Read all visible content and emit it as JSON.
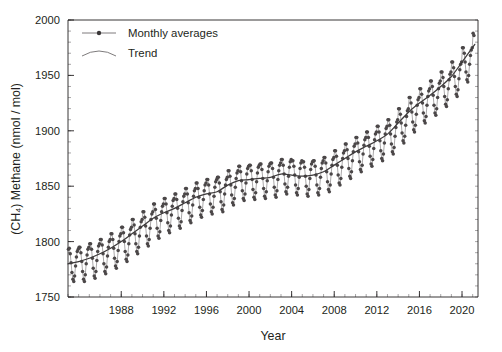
{
  "chart_data": {
    "type": "line",
    "title": "",
    "xlabel": "Year",
    "ylabel": "(CH₄) Methane (nmol / mol)",
    "xlim": [
      1983.0,
      2021.5
    ],
    "ylim": [
      1750,
      2000
    ],
    "xticks": [
      1988,
      1992,
      1996,
      2000,
      2004,
      2008,
      2012,
      2016,
      2020
    ],
    "xtick_labels": [
      "1988",
      "1992",
      "1996",
      "2000",
      "2004",
      "2008",
      "2012",
      "2016",
      "2020"
    ],
    "x_minor_step": 1,
    "yticks": [
      1750,
      1800,
      1850,
      1900,
      1950,
      2000
    ],
    "ytick_labels": [
      "1750",
      "1800",
      "1850",
      "1900",
      "1950",
      "2000"
    ],
    "y_minor_step": 10,
    "grid": false,
    "legend_position": "top-left",
    "legend": [
      {
        "label": "Monthly averages",
        "marker": "filled-circle",
        "line": "solid"
      },
      {
        "label": "Trend",
        "marker": "none",
        "line": "curve"
      }
    ],
    "series": [
      {
        "name": "Monthly averages",
        "color": "#4b4748",
        "x": [
          1983.04,
          1983.12,
          1983.21,
          1983.29,
          1983.37,
          1983.46,
          1983.54,
          1983.62,
          1983.71,
          1983.79,
          1983.87,
          1983.96,
          1984.04,
          1984.12,
          1984.21,
          1984.29,
          1984.37,
          1984.46,
          1984.54,
          1984.62,
          1984.71,
          1984.79,
          1984.87,
          1984.96,
          1985.04,
          1985.12,
          1985.21,
          1985.29,
          1985.37,
          1985.46,
          1985.54,
          1985.62,
          1985.71,
          1985.79,
          1985.87,
          1985.96,
          1986.04,
          1986.12,
          1986.21,
          1986.29,
          1986.37,
          1986.46,
          1986.54,
          1986.62,
          1986.71,
          1986.79,
          1986.87,
          1986.96,
          1987.04,
          1987.12,
          1987.21,
          1987.29,
          1987.37,
          1987.46,
          1987.54,
          1987.62,
          1987.71,
          1987.79,
          1987.87,
          1987.96,
          1988.04,
          1988.12,
          1988.21,
          1988.29,
          1988.37,
          1988.46,
          1988.54,
          1988.62,
          1988.71,
          1988.79,
          1988.87,
          1988.96,
          1989.04,
          1989.12,
          1989.21,
          1989.29,
          1989.37,
          1989.46,
          1989.54,
          1989.62,
          1989.71,
          1989.79,
          1989.87,
          1989.96,
          1990.04,
          1990.12,
          1990.21,
          1990.29,
          1990.37,
          1990.46,
          1990.54,
          1990.62,
          1990.71,
          1990.79,
          1990.87,
          1990.96,
          1991.04,
          1991.12,
          1991.21,
          1991.29,
          1991.37,
          1991.46,
          1991.54,
          1991.62,
          1991.71,
          1991.79,
          1991.87,
          1991.96,
          1992.04,
          1992.12,
          1992.21,
          1992.29,
          1992.37,
          1992.46,
          1992.54,
          1992.62,
          1992.71,
          1992.79,
          1992.87,
          1992.96,
          1993.04,
          1993.12,
          1993.21,
          1993.29,
          1993.37,
          1993.46,
          1993.54,
          1993.62,
          1993.71,
          1993.79,
          1993.87,
          1993.96,
          1994.04,
          1994.12,
          1994.21,
          1994.29,
          1994.37,
          1994.46,
          1994.54,
          1994.62,
          1994.71,
          1994.79,
          1994.87,
          1994.96,
          1995.04,
          1995.12,
          1995.21,
          1995.29,
          1995.37,
          1995.46,
          1995.54,
          1995.62,
          1995.71,
          1995.79,
          1995.87,
          1995.96,
          1996.04,
          1996.12,
          1996.21,
          1996.29,
          1996.37,
          1996.46,
          1996.54,
          1996.62,
          1996.71,
          1996.79,
          1996.87,
          1996.96,
          1997.04,
          1997.12,
          1997.21,
          1997.29,
          1997.37,
          1997.46,
          1997.54,
          1997.62,
          1997.71,
          1997.79,
          1997.87,
          1997.96,
          1998.04,
          1998.12,
          1998.21,
          1998.29,
          1998.37,
          1998.46,
          1998.54,
          1998.62,
          1998.71,
          1998.79,
          1998.87,
          1998.96,
          1999.04,
          1999.12,
          1999.21,
          1999.29,
          1999.37,
          1999.46,
          1999.54,
          1999.62,
          1999.71,
          1999.79,
          1999.87,
          1999.96,
          2000.04,
          2000.12,
          2000.21,
          2000.29,
          2000.37,
          2000.46,
          2000.54,
          2000.62,
          2000.71,
          2000.79,
          2000.87,
          2000.96,
          2001.04,
          2001.12,
          2001.21,
          2001.29,
          2001.37,
          2001.46,
          2001.54,
          2001.62,
          2001.71,
          2001.79,
          2001.87,
          2001.96,
          2002.04,
          2002.12,
          2002.21,
          2002.29,
          2002.37,
          2002.46,
          2002.54,
          2002.62,
          2002.71,
          2002.79,
          2002.87,
          2002.96,
          2003.04,
          2003.12,
          2003.21,
          2003.29,
          2003.37,
          2003.46,
          2003.54,
          2003.62,
          2003.71,
          2003.79,
          2003.87,
          2003.96,
          2004.04,
          2004.12,
          2004.21,
          2004.29,
          2004.37,
          2004.46,
          2004.54,
          2004.62,
          2004.71,
          2004.79,
          2004.87,
          2004.96,
          2005.04,
          2005.12,
          2005.21,
          2005.29,
          2005.37,
          2005.46,
          2005.54,
          2005.62,
          2005.71,
          2005.79,
          2005.87,
          2005.96,
          2006.04,
          2006.12,
          2006.21,
          2006.29,
          2006.37,
          2006.46,
          2006.54,
          2006.62,
          2006.71,
          2006.79,
          2006.87,
          2006.96,
          2007.04,
          2007.12,
          2007.21,
          2007.29,
          2007.37,
          2007.46,
          2007.54,
          2007.62,
          2007.71,
          2007.79,
          2007.87,
          2007.96,
          2008.04,
          2008.12,
          2008.21,
          2008.29,
          2008.37,
          2008.46,
          2008.54,
          2008.62,
          2008.71,
          2008.79,
          2008.87,
          2008.96,
          2009.04,
          2009.12,
          2009.21,
          2009.29,
          2009.37,
          2009.46,
          2009.54,
          2009.62,
          2009.71,
          2009.79,
          2009.87,
          2009.96,
          2010.04,
          2010.12,
          2010.21,
          2010.29,
          2010.37,
          2010.46,
          2010.54,
          2010.62,
          2010.71,
          2010.79,
          2010.87,
          2010.96,
          2011.04,
          2011.12,
          2011.21,
          2011.29,
          2011.37,
          2011.46,
          2011.54,
          2011.62,
          2011.71,
          2011.79,
          2011.87,
          2011.96,
          2012.04,
          2012.12,
          2012.21,
          2012.29,
          2012.37,
          2012.46,
          2012.54,
          2012.62,
          2012.71,
          2012.79,
          2012.87,
          2012.96,
          2013.04,
          2013.12,
          2013.21,
          2013.29,
          2013.37,
          2013.46,
          2013.54,
          2013.62,
          2013.71,
          2013.79,
          2013.87,
          2013.96,
          2014.04,
          2014.12,
          2014.21,
          2014.29,
          2014.37,
          2014.46,
          2014.54,
          2014.62,
          2014.71,
          2014.79,
          2014.87,
          2014.96,
          2015.04,
          2015.12,
          2015.21,
          2015.29,
          2015.37,
          2015.46,
          2015.54,
          2015.62,
          2015.71,
          2015.79,
          2015.87,
          2015.96,
          2016.04,
          2016.12,
          2016.21,
          2016.29,
          2016.37,
          2016.46,
          2016.54,
          2016.62,
          2016.71,
          2016.79,
          2016.87,
          2016.96,
          2017.04,
          2017.12,
          2017.21,
          2017.29,
          2017.37,
          2017.46,
          2017.54,
          2017.62,
          2017.71,
          2017.79,
          2017.87,
          2017.96,
          2018.04,
          2018.12,
          2018.21,
          2018.29,
          2018.37,
          2018.46,
          2018.54,
          2018.62,
          2018.71,
          2018.79,
          2018.87,
          2018.96,
          2019.04,
          2019.12,
          2019.21,
          2019.29,
          2019.37,
          2019.46,
          2019.54,
          2019.62,
          2019.71,
          2019.79,
          2019.87,
          2019.96,
          2020.04,
          2020.12,
          2020.21,
          2020.29,
          2020.37,
          2020.46,
          2020.54,
          2020.62,
          2020.71,
          2020.79,
          2020.87,
          2020.96,
          2021.04,
          2021.12
        ],
        "values": [
          1793,
          1794,
          1789,
          1781,
          1772,
          1766,
          1764,
          1769,
          1778,
          1786,
          1791,
          1793,
          1795,
          1795,
          1790,
          1782,
          1773,
          1766,
          1764,
          1770,
          1780,
          1788,
          1793,
          1795,
          1798,
          1798,
          1793,
          1785,
          1776,
          1769,
          1767,
          1773,
          1783,
          1791,
          1796,
          1798,
          1802,
          1802,
          1797,
          1789,
          1780,
          1773,
          1771,
          1777,
          1787,
          1795,
          1800,
          1802,
          1807,
          1807,
          1802,
          1794,
          1785,
          1778,
          1776,
          1782,
          1792,
          1800,
          1805,
          1807,
          1813,
          1813,
          1808,
          1800,
          1791,
          1784,
          1782,
          1788,
          1798,
          1806,
          1811,
          1813,
          1820,
          1820,
          1815,
          1807,
          1798,
          1791,
          1789,
          1795,
          1805,
          1813,
          1818,
          1820,
          1827,
          1827,
          1822,
          1814,
          1805,
          1798,
          1796,
          1802,
          1812,
          1820,
          1825,
          1827,
          1834,
          1834,
          1829,
          1821,
          1812,
          1805,
          1803,
          1809,
          1819,
          1827,
          1832,
          1834,
          1839,
          1839,
          1834,
          1826,
          1817,
          1810,
          1808,
          1814,
          1824,
          1832,
          1837,
          1839,
          1843,
          1843,
          1838,
          1830,
          1821,
          1814,
          1812,
          1818,
          1828,
          1836,
          1841,
          1843,
          1848,
          1848,
          1843,
          1835,
          1826,
          1819,
          1817,
          1823,
          1833,
          1841,
          1846,
          1848,
          1853,
          1853,
          1848,
          1840,
          1831,
          1824,
          1822,
          1828,
          1838,
          1846,
          1851,
          1853,
          1856,
          1856,
          1851,
          1843,
          1834,
          1827,
          1825,
          1831,
          1841,
          1849,
          1854,
          1856,
          1858,
          1858,
          1853,
          1845,
          1836,
          1829,
          1827,
          1833,
          1843,
          1851,
          1856,
          1858,
          1864,
          1864,
          1859,
          1851,
          1842,
          1835,
          1833,
          1839,
          1849,
          1857,
          1862,
          1864,
          1868,
          1868,
          1863,
          1855,
          1846,
          1839,
          1837,
          1843,
          1853,
          1861,
          1866,
          1868,
          1869,
          1869,
          1864,
          1856,
          1847,
          1840,
          1838,
          1844,
          1854,
          1862,
          1867,
          1869,
          1870,
          1870,
          1865,
          1857,
          1848,
          1841,
          1839,
          1845,
          1855,
          1863,
          1868,
          1870,
          1871,
          1871,
          1866,
          1858,
          1849,
          1842,
          1840,
          1846,
          1856,
          1864,
          1869,
          1871,
          1874,
          1874,
          1869,
          1861,
          1852,
          1845,
          1843,
          1849,
          1859,
          1867,
          1872,
          1874,
          1873,
          1873,
          1868,
          1860,
          1851,
          1844,
          1842,
          1848,
          1858,
          1866,
          1871,
          1873,
          1872,
          1872,
          1867,
          1859,
          1850,
          1843,
          1841,
          1847,
          1857,
          1865,
          1870,
          1872,
          1873,
          1873,
          1868,
          1860,
          1851,
          1844,
          1842,
          1848,
          1858,
          1866,
          1871,
          1873,
          1876,
          1876,
          1871,
          1863,
          1854,
          1847,
          1845,
          1851,
          1861,
          1869,
          1874,
          1876,
          1882,
          1882,
          1877,
          1869,
          1860,
          1853,
          1851,
          1857,
          1867,
          1875,
          1880,
          1882,
          1888,
          1888,
          1883,
          1875,
          1866,
          1859,
          1857,
          1863,
          1873,
          1881,
          1886,
          1888,
          1894,
          1894,
          1889,
          1881,
          1872,
          1865,
          1863,
          1869,
          1879,
          1887,
          1892,
          1894,
          1899,
          1899,
          1894,
          1886,
          1877,
          1870,
          1868,
          1874,
          1884,
          1892,
          1897,
          1899,
          1904,
          1904,
          1899,
          1891,
          1882,
          1875,
          1873,
          1879,
          1889,
          1897,
          1902,
          1904,
          1910,
          1910,
          1905,
          1897,
          1888,
          1881,
          1879,
          1885,
          1895,
          1903,
          1908,
          1910,
          1920,
          1920,
          1915,
          1907,
          1898,
          1891,
          1889,
          1895,
          1905,
          1913,
          1918,
          1920,
          1930,
          1930,
          1925,
          1917,
          1908,
          1901,
          1899,
          1905,
          1915,
          1923,
          1928,
          1930,
          1938,
          1938,
          1933,
          1925,
          1916,
          1909,
          1907,
          1913,
          1923,
          1931,
          1936,
          1938,
          1945,
          1945,
          1940,
          1932,
          1923,
          1916,
          1914,
          1920,
          1930,
          1938,
          1943,
          1945,
          1953,
          1953,
          1948,
          1940,
          1931,
          1924,
          1922,
          1928,
          1938,
          1946,
          1951,
          1953,
          1962,
          1962,
          1957,
          1949,
          1940,
          1933,
          1931,
          1937,
          1947,
          1955,
          1960,
          1962,
          1975,
          1975,
          1970,
          1962,
          1953,
          1946,
          1944,
          1950,
          1960,
          1968,
          1973,
          1975,
          1988,
          1986
        ]
      },
      {
        "name": "Trend",
        "color": "#3d3a3b",
        "x": [
          1983.0,
          1984.0,
          1985.0,
          1986.0,
          1987.0,
          1988.0,
          1989.0,
          1990.0,
          1991.0,
          1992.0,
          1993.0,
          1994.0,
          1995.0,
          1996.0,
          1997.0,
          1998.0,
          1999.0,
          2000.0,
          2001.0,
          2002.0,
          2003.0,
          2004.0,
          2005.0,
          2006.0,
          2007.0,
          2008.0,
          2009.0,
          2010.0,
          2011.0,
          2012.0,
          2013.0,
          2014.0,
          2015.0,
          2016.0,
          2017.0,
          2018.0,
          2019.0,
          2020.0,
          2021.2
        ],
        "values": [
          1780,
          1782,
          1785,
          1789,
          1794,
          1800,
          1807,
          1814,
          1821,
          1826,
          1830,
          1835,
          1840,
          1843,
          1845,
          1851,
          1855,
          1856,
          1857,
          1858,
          1861,
          1860,
          1859,
          1860,
          1863,
          1869,
          1875,
          1881,
          1886,
          1891,
          1897,
          1907,
          1917,
          1925,
          1932,
          1940,
          1949,
          1962,
          1978
        ]
      }
    ]
  }
}
